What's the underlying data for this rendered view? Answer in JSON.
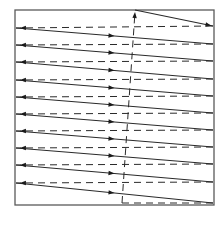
{
  "diagram": {
    "type": "raster-scan",
    "frame": {
      "x": 15,
      "y": 10,
      "width": 199,
      "height": 195,
      "stroke": "#5a5a5a"
    },
    "line_color": "#2a2a2a",
    "line_count": 11,
    "scan_lines": [
      {
        "x1": 135,
        "y1": 10,
        "x2": 213,
        "y2": 26
      },
      {
        "x1": 16,
        "y1": 28,
        "x2": 213,
        "y2": 44
      },
      {
        "x1": 16,
        "y1": 45,
        "x2": 213,
        "y2": 61
      },
      {
        "x1": 16,
        "y1": 62,
        "x2": 213,
        "y2": 79
      },
      {
        "x1": 16,
        "y1": 80,
        "x2": 213,
        "y2": 96
      },
      {
        "x1": 16,
        "y1": 97,
        "x2": 213,
        "y2": 113
      },
      {
        "x1": 16,
        "y1": 114,
        "x2": 213,
        "y2": 130
      },
      {
        "x1": 16,
        "y1": 131,
        "x2": 213,
        "y2": 147
      },
      {
        "x1": 16,
        "y1": 148,
        "x2": 213,
        "y2": 164
      },
      {
        "x1": 16,
        "y1": 165,
        "x2": 213,
        "y2": 182
      },
      {
        "x1": 16,
        "y1": 183,
        "x2": 213,
        "y2": 203
      }
    ],
    "horizontal_retraces": [
      {
        "x1": 213,
        "y1": 26,
        "x2": 16,
        "y2": 28
      },
      {
        "x1": 213,
        "y1": 44,
        "x2": 16,
        "y2": 45
      },
      {
        "x1": 213,
        "y1": 61,
        "x2": 16,
        "y2": 62
      },
      {
        "x1": 213,
        "y1": 79,
        "x2": 16,
        "y2": 80
      },
      {
        "x1": 213,
        "y1": 96,
        "x2": 16,
        "y2": 97
      },
      {
        "x1": 213,
        "y1": 113,
        "x2": 16,
        "y2": 114
      },
      {
        "x1": 213,
        "y1": 130,
        "x2": 16,
        "y2": 131
      },
      {
        "x1": 213,
        "y1": 147,
        "x2": 16,
        "y2": 148
      },
      {
        "x1": 213,
        "y1": 164,
        "x2": 16,
        "y2": 165
      },
      {
        "x1": 213,
        "y1": 182,
        "x2": 16,
        "y2": 183
      }
    ],
    "vertical_retrace": {
      "x1": 213,
      "y1": 203,
      "bottom_x": 122,
      "bottom_y": 203,
      "x2": 135,
      "y2": 12
    },
    "legend": {
      "solid": "active scan line (left to right)",
      "dashed": "horizontal retrace (right to left)",
      "vertical_dashed": "vertical retrace (bottom to top)"
    }
  }
}
